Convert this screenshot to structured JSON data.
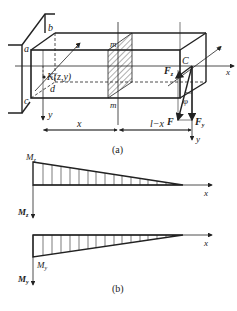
{
  "figure": {
    "part_a": {
      "caption": "(a)",
      "points": {
        "a": "a",
        "b": "b",
        "c": "c",
        "d": "d",
        "C": "C"
      },
      "point_K": "K(z,y)",
      "section": "m",
      "axes": {
        "x": "x",
        "y": "y",
        "z": "z"
      },
      "forces": {
        "F": "F",
        "Fy": "F",
        "Fy_sub": "y",
        "Fz": "F",
        "Fz_sub": "z"
      },
      "angle": "φ",
      "dimensions": {
        "left": "x",
        "right": "l−x"
      }
    },
    "part_b": {
      "caption": "(b)",
      "moment_z": {
        "label": "M",
        "sub": "z",
        "axis_label": "M",
        "axis_sub": "z",
        "x_axis": "x"
      },
      "moment_y": {
        "label": "M",
        "sub": "y",
        "axis_label": "M",
        "axis_sub": "y",
        "x_axis": "x"
      }
    }
  }
}
